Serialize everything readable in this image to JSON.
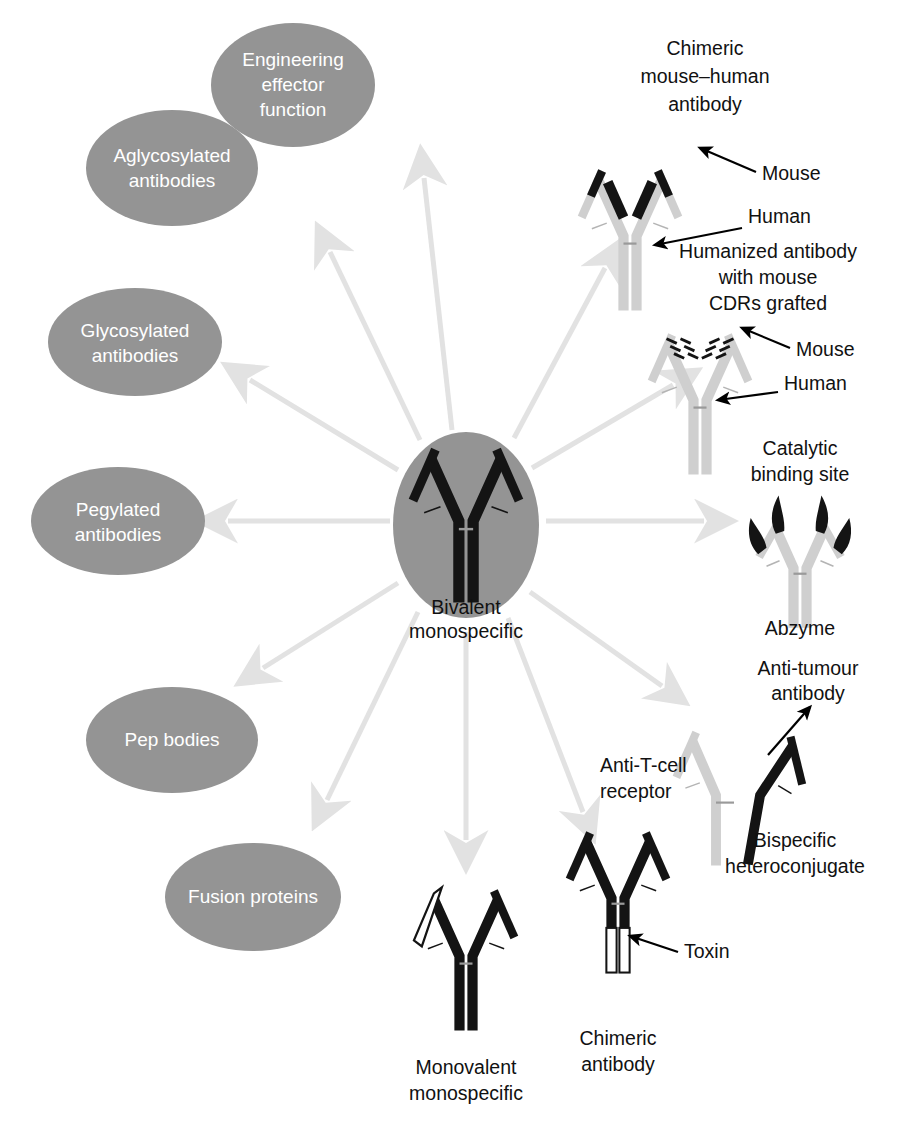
{
  "figure": {
    "center_caption_line1": "Bivalent",
    "center_caption_line2": "monospecific"
  },
  "colors": {
    "ellipse_fill": "#949494",
    "ellipse_text": "#ffffff",
    "arrow": "#e2e2e2",
    "chain_black": "#141414",
    "chain_gray": "#cfcfcf",
    "chain_white": "#ffffff",
    "caption_text": "#111111",
    "background": "#ffffff",
    "pointer_black": "#000000"
  },
  "ellipses": [
    {
      "id": "engineering-effector-function",
      "lines": [
        "Engineering",
        "effector",
        "function"
      ],
      "cx": 293,
      "cy": 85,
      "rx": 82,
      "ry": 62
    },
    {
      "id": "aglycosylated-antibodies",
      "lines": [
        "Aglycosylated",
        "antibodies"
      ],
      "cx": 172,
      "cy": 168,
      "rx": 86,
      "ry": 58
    },
    {
      "id": "glycosylated-antibodies",
      "lines": [
        "Glycosylated",
        "antibodies"
      ],
      "cx": 135,
      "cy": 342,
      "rx": 87,
      "ry": 54
    },
    {
      "id": "pegylated-antibodies",
      "lines": [
        "Pegylated",
        "antibodies"
      ],
      "cx": 118,
      "cy": 521,
      "rx": 87,
      "ry": 54
    },
    {
      "id": "pep-bodies",
      "lines": [
        "Pep bodies"
      ],
      "cx": 172,
      "cy": 740,
      "rx": 86,
      "ry": 53
    },
    {
      "id": "fusion-proteins",
      "lines": [
        "Fusion proteins"
      ],
      "cx": 253,
      "cy": 897,
      "rx": 88,
      "ry": 54
    }
  ],
  "center_node": {
    "cx": 466,
    "cy": 525,
    "rx": 73,
    "ry": 93
  },
  "arrows": [
    {
      "id": "arrow-to-engineering-effector-function",
      "x1": 452,
      "y1": 430,
      "x2": 424,
      "y2": 170
    },
    {
      "id": "arrow-to-aglycosylated-antibodies",
      "x1": 420,
      "y1": 440,
      "x2": 327,
      "y2": 248
    },
    {
      "id": "arrow-to-glycosylated-antibodies",
      "x1": 398,
      "y1": 470,
      "x2": 245,
      "y2": 378
    },
    {
      "id": "arrow-to-pegylated-antibodies",
      "x1": 388,
      "y1": 522,
      "x2": 222,
      "y2": 521
    },
    {
      "id": "arrow-to-pep-bodies",
      "x1": 398,
      "y1": 583,
      "x2": 258,
      "y2": 672
    },
    {
      "id": "arrow-to-fusion-proteins",
      "x1": 418,
      "y1": 612,
      "x2": 325,
      "y2": 805
    },
    {
      "id": "arrow-to-monovalent-monospecific",
      "x1": 466,
      "y1": 630,
      "x2": 466,
      "y2": 845
    },
    {
      "id": "arrow-to-chimeric-antibody-toxin",
      "x1": 508,
      "y1": 618,
      "x2": 585,
      "y2": 818
    },
    {
      "id": "arrow-to-bispecific-heteroconjugate",
      "x1": 530,
      "y1": 592,
      "x2": 667,
      "y2": 690
    },
    {
      "id": "arrow-to-abzyme",
      "x1": 544,
      "y1": 521,
      "x2": 710,
      "y2": 521
    },
    {
      "id": "arrow-to-humanized-antibody",
      "x1": 532,
      "y1": 468,
      "x2": 678,
      "y2": 382
    },
    {
      "id": "arrow-to-chimeric-mouse-human-antibody",
      "x1": 514,
      "y1": 438,
      "x2": 608,
      "y2": 262
    }
  ],
  "structures": [
    {
      "id": "chimeric-mouse-human-antibody",
      "caption_lines": [
        "Chimeric",
        "mouse–human",
        "antibody"
      ],
      "caption_x": 705,
      "caption_y": 55,
      "callouts": [
        {
          "id": "callout-mouse",
          "label": "Mouse",
          "x": 766,
          "y": 178
        },
        {
          "id": "callout-human",
          "label": "Human",
          "x": 755,
          "y": 222
        }
      ]
    },
    {
      "id": "humanized-antibody",
      "caption_lines": [
        "Humanized antibody",
        "with mouse",
        "CDRs grafted"
      ],
      "caption_x": 768,
      "caption_y": 258,
      "callouts": [
        {
          "id": "callout-mouse",
          "label": "Mouse",
          "x": 800,
          "y": 352
        },
        {
          "id": "callout-human",
          "label": "Human",
          "x": 790,
          "y": 390
        }
      ]
    },
    {
      "id": "abzyme",
      "caption_lines": [
        "Abzyme"
      ],
      "caption_x": 800,
      "caption_y": 628,
      "callouts": [
        {
          "id": "callout-catalytic-binding-site-line1",
          "label": "Catalytic",
          "x": 800,
          "y": 448
        },
        {
          "id": "callout-catalytic-binding-site-line2",
          "label": "binding site",
          "x": 800,
          "y": 474
        }
      ]
    },
    {
      "id": "bispecific-heteroconjugate",
      "caption_lines": [
        "Bispecific",
        "heteroconjugate"
      ],
      "caption_x": 795,
      "caption_y": 840,
      "callouts": [
        {
          "id": "callout-anti-tumour-antibody-line1",
          "label": "Anti-tumour",
          "x": 808,
          "y": 668
        },
        {
          "id": "callout-anti-tumour-antibody-line2",
          "label": "antibody",
          "x": 808,
          "y": 693
        },
        {
          "id": "callout-anti-t-cell-receptor-line1",
          "label": "Anti-T-cell",
          "x": 600,
          "y": 765
        },
        {
          "id": "callout-anti-t-cell-receptor-line2",
          "label": "receptor",
          "x": 600,
          "y": 791
        }
      ]
    },
    {
      "id": "chimeric-antibody-toxin",
      "caption_lines": [
        "Chimeric",
        "antibody"
      ],
      "caption_x": 618,
      "caption_y": 1038,
      "callouts": [
        {
          "id": "callout-toxin",
          "label": "Toxin",
          "x": 690,
          "y": 949
        }
      ]
    },
    {
      "id": "monovalent-monospecific",
      "caption_lines": [
        "Monovalent",
        "monospecific"
      ],
      "caption_x": 466,
      "caption_y": 1067,
      "callouts": []
    }
  ]
}
